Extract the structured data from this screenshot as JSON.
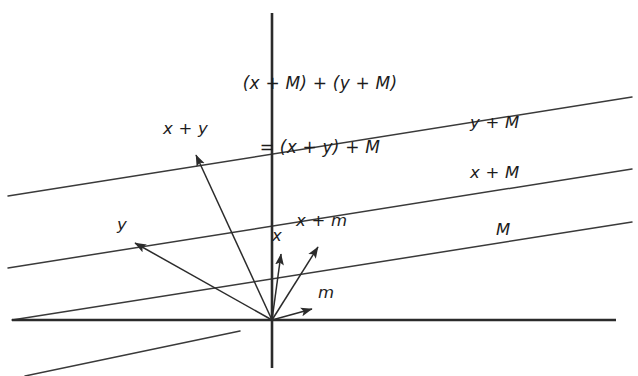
{
  "figure": {
    "kind": "vector-addition-diagram",
    "background_color": "#ffffff",
    "stroke_color": "#3a3a3a",
    "axis_color": "#2b2b2b",
    "text_color": "#1c1c1c",
    "width": 638,
    "height": 376
  },
  "title": {
    "line1": "(x + M) + (y + M)",
    "line2": "= (x + y) + M"
  },
  "coset_lines": [
    {
      "label": "y + M",
      "label_x": 470,
      "label_y": 113,
      "x1": 8,
      "y1": 196,
      "x2": 632,
      "y2": 97
    },
    {
      "label": "x + M",
      "label_x": 470,
      "label_y": 163,
      "x1": 8,
      "y1": 268,
      "x2": 632,
      "y2": 169
    },
    {
      "label": "M",
      "label_x": 496,
      "label_y": 220,
      "x1": 12,
      "y1": 320,
      "x2": 632,
      "y2": 222
    },
    {
      "label": "",
      "label_x": 0,
      "label_y": 0,
      "x1": 25,
      "y1": 376,
      "x2": 240,
      "y2": 331
    }
  ],
  "top_line": {
    "x1": 8,
    "y1": 196,
    "x2": 632,
    "y2": 97
  },
  "axes": {
    "x_axis": {
      "x1": 12,
      "y1": 320,
      "x2": 616,
      "y2": 320
    },
    "y_axis": {
      "x1": 272,
      "y1": 13,
      "x2": 272,
      "y2": 368
    },
    "origin_x": 272,
    "origin_y": 320
  },
  "vectors": [
    {
      "label": "x + y",
      "label_x": 163,
      "label_y": 119,
      "tip_x": 196,
      "tip_y": 155
    },
    {
      "label": "y",
      "label_x": 117,
      "label_y": 215,
      "tip_x": 135,
      "tip_y": 243
    },
    {
      "label": "x",
      "label_x": 272,
      "label_y": 226,
      "tip_x": 281,
      "tip_y": 254
    },
    {
      "label": "x + m",
      "label_x": 296,
      "label_y": 211,
      "tip_x": 318,
      "tip_y": 247
    },
    {
      "label": "m",
      "label_x": 318,
      "label_y": 283,
      "tip_x": 312,
      "tip_y": 309
    }
  ]
}
